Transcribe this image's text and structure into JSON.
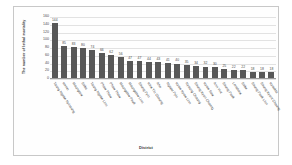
{
  "chart_data": {
    "type": "bar",
    "title": "",
    "xlabel": "District",
    "ylabel": "The number of lethal mortality",
    "ylim": [
      0,
      160
    ],
    "yticks": [
      160,
      140,
      120,
      100,
      80,
      60,
      40,
      20,
      0
    ],
    "grid": true,
    "legend": "none",
    "bar_color": "#585858",
    "categories": [
      "Taung Ngoke Nyinaung",
      "Kemo",
      "Maungtaw",
      "Saba",
      "Taung Ngoke Linn",
      "Phaw Thaw",
      "Phaw Thaw",
      "Maungdaw Pauk",
      "Maungdaw Linn",
      "Saung Pyin",
      "Kaw Yin Chaung",
      "Aho",
      "Ngapu Pyin",
      "Kyaw Kyaw Linn",
      "Nyaung Chaung",
      "Saung Kyan Chaung",
      "Kyaw Saw",
      "Ann Yint",
      "Saung Pauk",
      "Lonkhaw",
      "Sabe",
      "Saung Pauk Linn",
      "Saung Kyant Chaung",
      "Kyaukta"
    ],
    "values": [
      144,
      85,
      83,
      80,
      74,
      66,
      62,
      56,
      47,
      47,
      44,
      43,
      41,
      40,
      35,
      34,
      32,
      30,
      25,
      22,
      22,
      18,
      18,
      18
    ]
  }
}
